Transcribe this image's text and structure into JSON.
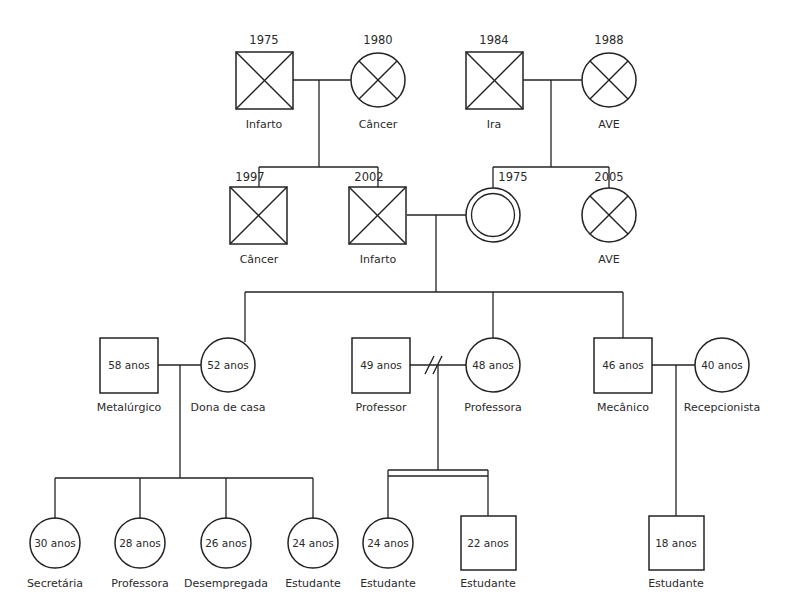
{
  "diagram": {
    "type": "genogram",
    "title_visible": false,
    "background_color": "#ffffff",
    "line_color": "#232323",
    "generations": 4
  },
  "generation1": {
    "label": "grandparents",
    "people": [
      {
        "id": "g1-p1",
        "shape": "square",
        "deceased": true,
        "sex": "male",
        "year": "1975",
        "caption": "Infarto",
        "cx": 264,
        "cy": 80
      },
      {
        "id": "g1-p2",
        "shape": "circle",
        "deceased": true,
        "sex": "female",
        "year": "1980",
        "caption": "Câncer",
        "cx": 378,
        "cy": 80
      },
      {
        "id": "g1-p3",
        "shape": "square",
        "deceased": true,
        "sex": "male",
        "year": "1984",
        "caption": "Ira",
        "cx": 494,
        "cy": 80
      },
      {
        "id": "g1-p4",
        "shape": "circle",
        "deceased": true,
        "sex": "female",
        "year": "1988",
        "caption": "AVE",
        "cx": 609,
        "cy": 80
      }
    ]
  },
  "generation2": {
    "label": "parents",
    "people": [
      {
        "id": "g2-p1",
        "shape": "square",
        "deceased": true,
        "sex": "male",
        "year": "1997",
        "caption": "Câncer",
        "cx": 259,
        "cy": 215
      },
      {
        "id": "g2-p2",
        "shape": "square",
        "deceased": true,
        "sex": "male",
        "year": "2002",
        "caption": "Infarto",
        "cx": 378,
        "cy": 215
      },
      {
        "id": "g2-p3",
        "shape": "double-circle",
        "deceased": false,
        "index_person": true,
        "sex": "female",
        "year": "1975",
        "caption": "",
        "cx": 493,
        "cy": 215
      },
      {
        "id": "g2-p4",
        "shape": "circle",
        "deceased": true,
        "sex": "female",
        "year": "2005",
        "caption": "AVE",
        "cx": 609,
        "cy": 215
      }
    ]
  },
  "generation3": {
    "label": "children",
    "people": [
      {
        "id": "g3-p1",
        "shape": "square",
        "deceased": false,
        "sex": "male",
        "age": "58 anos",
        "caption": "Metalúrgico",
        "cx": 129,
        "cy": 365
      },
      {
        "id": "g3-p2",
        "shape": "circle",
        "deceased": false,
        "sex": "female",
        "age": "52 anos",
        "caption": "Dona de casa",
        "cx": 228,
        "cy": 365
      },
      {
        "id": "g3-p3",
        "shape": "square",
        "deceased": false,
        "sex": "male",
        "age": "49 anos",
        "caption": "Professor",
        "cx": 381,
        "cy": 365
      },
      {
        "id": "g3-p4",
        "shape": "circle",
        "deceased": false,
        "sex": "female",
        "age": "48 anos",
        "caption": "Professora",
        "cx": 493,
        "cy": 365
      },
      {
        "id": "g3-p5",
        "shape": "square",
        "deceased": false,
        "sex": "male",
        "age": "46 anos",
        "caption": "Mecânico",
        "cx": 623,
        "cy": 365
      },
      {
        "id": "g3-p6",
        "shape": "circle",
        "deceased": false,
        "sex": "female",
        "age": "40 anos",
        "caption": "Recepcionista",
        "cx": 722,
        "cy": 365
      }
    ],
    "relationship_markers": [
      {
        "id": "divorce-1",
        "type": "divorce",
        "between": [
          "g3-p3",
          "g3-p4"
        ],
        "glyph": "double-slash"
      }
    ]
  },
  "generation4": {
    "label": "grandchildren",
    "people": [
      {
        "id": "g4-p1",
        "shape": "circle",
        "deceased": false,
        "sex": "female",
        "age": "30 anos",
        "caption": "Secretária",
        "cx": 55,
        "cy": 543
      },
      {
        "id": "g4-p2",
        "shape": "circle",
        "deceased": false,
        "sex": "female",
        "age": "28 anos",
        "caption": "Professora",
        "cx": 140,
        "cy": 543
      },
      {
        "id": "g4-p3",
        "shape": "circle",
        "deceased": false,
        "sex": "female",
        "age": "26 anos",
        "caption": "Desempregada",
        "cx": 226,
        "cy": 543
      },
      {
        "id": "g4-p4",
        "shape": "circle",
        "deceased": false,
        "sex": "female",
        "age": "24 anos",
        "caption": "Estudante",
        "cx": 313,
        "cy": 543
      },
      {
        "id": "g4-p5",
        "shape": "circle",
        "deceased": false,
        "sex": "female",
        "age": "24 anos",
        "caption": "Estudante",
        "cx": 388,
        "cy": 543
      },
      {
        "id": "g4-p6",
        "shape": "square",
        "deceased": false,
        "sex": "male",
        "age": "22 anos",
        "caption": "Estudante",
        "cx": 488,
        "cy": 543
      },
      {
        "id": "g4-p7",
        "shape": "square",
        "deceased": false,
        "sex": "male",
        "age": "18 anos",
        "caption": "Estudante",
        "cx": 676,
        "cy": 543
      }
    ],
    "sibling_markers": [
      {
        "id": "twins-1",
        "type": "twins",
        "between": [
          "g4-p5",
          "g4-p6"
        ],
        "glyph": "double-horizontal-bar"
      }
    ]
  },
  "legend_notes": {
    "square_meaning": "male",
    "circle_meaning": "female",
    "x_meaning": "deceased",
    "double_circle_meaning": "index-person",
    "double_slash_meaning": "divorce",
    "double_bar_meaning": "twins"
  }
}
